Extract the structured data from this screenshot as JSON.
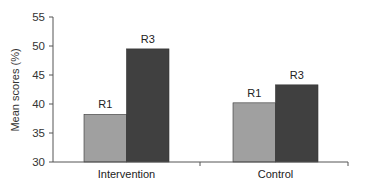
{
  "chart_data": {
    "type": "bar",
    "title": "",
    "xlabel": "",
    "ylabel": "Mean scores (%)",
    "ylim": [
      30,
      55
    ],
    "yticks": [
      30,
      35,
      40,
      45,
      50,
      55
    ],
    "categories": [
      "Intervention",
      "Control"
    ],
    "series": [
      {
        "name": "R1",
        "color": "#a0a0a0",
        "values": [
          38.2,
          40.2
        ]
      },
      {
        "name": "R3",
        "color": "#404040",
        "values": [
          49.5,
          43.3
        ]
      }
    ],
    "grid": false,
    "legend": "none (bars labeled directly)"
  }
}
